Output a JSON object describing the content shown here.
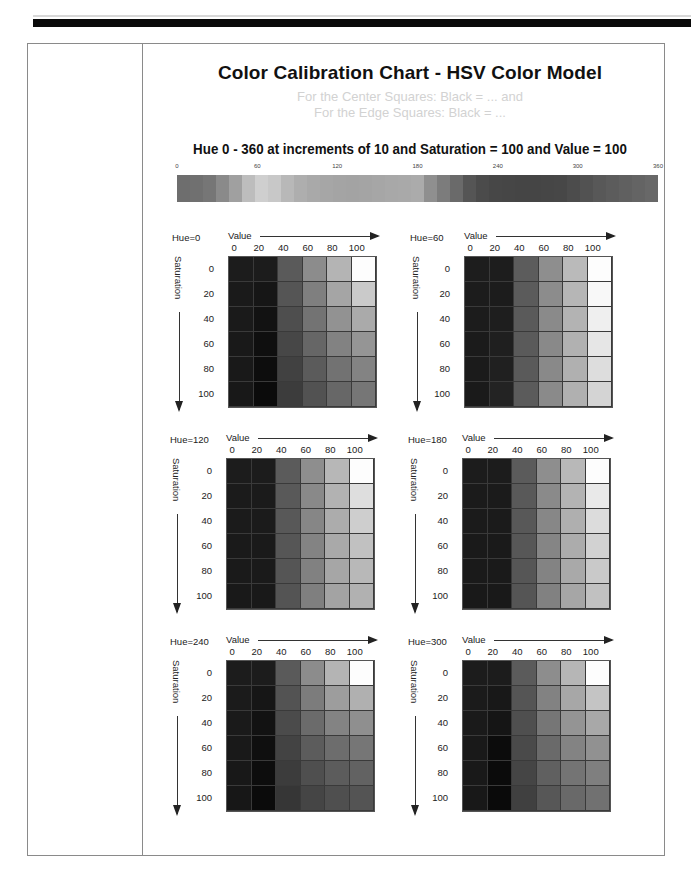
{
  "title": "Color Calibration Chart - HSV Color Model",
  "ghost_text": [
    "For the Center Squares: Black = ... and",
    "For the Edge Squares: Black = ..."
  ],
  "subtitle": "Hue 0 - 360 at increments of 10 and Saturation = 100 and Value = 100",
  "chart_data": {
    "type": "heatmap",
    "title": "Color Calibration Chart - HSV Color Model",
    "hue_strip": {
      "title": "Hue 0 - 360 at increments of 10 and Saturation = 100 and Value = 100",
      "tick_labels": [
        "0",
        "60",
        "120",
        "180",
        "240",
        "300",
        "360"
      ],
      "tick_positions_pct": [
        0,
        16.7,
        33.3,
        50,
        66.7,
        83.3,
        100
      ],
      "hues": [
        0,
        10,
        20,
        30,
        40,
        50,
        60,
        70,
        80,
        90,
        100,
        110,
        120,
        130,
        140,
        150,
        160,
        170,
        180,
        190,
        200,
        210,
        220,
        230,
        240,
        250,
        260,
        270,
        280,
        290,
        300,
        310,
        320,
        330,
        340,
        350,
        360
      ],
      "gray_levels": [
        "#6e6e6e",
        "#707070",
        "#767676",
        "#8a8a8a",
        "#a0a0a0",
        "#bdbdbd",
        "#cfcfcf",
        "#c8c8c8",
        "#b8b8b8",
        "#aeaeae",
        "#a9a9a9",
        "#a6a6a6",
        "#a4a4a4",
        "#a3a3a3",
        "#a4a4a4",
        "#a6a6a6",
        "#a8a8a8",
        "#a9a9a9",
        "#ababab",
        "#8f8f8f",
        "#7c7c7c",
        "#6a6a6a",
        "#555555",
        "#4b4b4b",
        "#474747",
        "#464646",
        "#454545",
        "#454545",
        "#464646",
        "#474747",
        "#4c4c4c",
        "#525252",
        "#585858",
        "#5c5c5c",
        "#606060",
        "#646464",
        "#686868"
      ]
    },
    "grids": [
      {
        "hue_label": "Hue=0",
        "hue": 0
      },
      {
        "hue_label": "Hue=60",
        "hue": 60
      },
      {
        "hue_label": "Hue=120",
        "hue": 120
      },
      {
        "hue_label": "Hue=180",
        "hue": 180
      },
      {
        "hue_label": "Hue=240",
        "hue": 240
      },
      {
        "hue_label": "Hue=300",
        "hue": 300
      }
    ],
    "xlabel": "Value",
    "ylabel": "Saturation",
    "x_ticks": [
      "0",
      "20",
      "40",
      "60",
      "80",
      "100"
    ],
    "y_ticks": [
      "0",
      "20",
      "40",
      "60",
      "80",
      "100"
    ],
    "rendering": "grayscale scan"
  },
  "grids": [
    {
      "hue_label": "Hue=0",
      "value_label": "Value",
      "sat_label": "Saturation",
      "rows": [
        [
          "#1c1c1c",
          "#1c1c1c",
          "#5a5a5a",
          "#8c8c8c",
          "#b4b4b4",
          "#fdfdfd"
        ],
        [
          "#1a1a1a",
          "#161616",
          "#555555",
          "#7f7f7f",
          "#a5a5a5",
          "#cacaca"
        ],
        [
          "#1a1a1a",
          "#121212",
          "#4e4e4e",
          "#737373",
          "#929292",
          "#aaaaaa"
        ],
        [
          "#191919",
          "#0f0f0f",
          "#474747",
          "#666666",
          "#828282",
          "#959595"
        ],
        [
          "#191919",
          "#0d0d0d",
          "#414141",
          "#5b5b5b",
          "#727272",
          "#838383"
        ],
        [
          "#181818",
          "#0b0b0b",
          "#3c3c3c",
          "#525252",
          "#676767",
          "#767676"
        ]
      ]
    },
    {
      "hue_label": "Hue=60",
      "value_label": "Value",
      "sat_label": "Saturation",
      "rows": [
        [
          "#1d1d1d",
          "#1d1d1d",
          "#5c5c5c",
          "#8e8e8e",
          "#bababa",
          "#fdfdfd"
        ],
        [
          "#1c1c1c",
          "#1c1c1c",
          "#5b5b5b",
          "#8c8c8c",
          "#b6b6b6",
          "#f8f8f8"
        ],
        [
          "#1c1c1c",
          "#1e1e1e",
          "#5a5a5a",
          "#8a8a8a",
          "#b3b3b3",
          "#efefef"
        ],
        [
          "#1b1b1b",
          "#1f1f1f",
          "#5a5a5a",
          "#898989",
          "#b1b1b1",
          "#e6e6e6"
        ],
        [
          "#1b1b1b",
          "#202020",
          "#5a5a5a",
          "#898989",
          "#b0b0b0",
          "#dddddd"
        ],
        [
          "#1a1a1a",
          "#232323",
          "#5b5b5b",
          "#8a8a8a",
          "#b0b0b0",
          "#d4d4d4"
        ]
      ]
    },
    {
      "hue_label": "Hue=120",
      "value_label": "Value",
      "sat_label": "Saturation",
      "rows": [
        [
          "#1c1c1c",
          "#1c1c1c",
          "#5b5b5b",
          "#8e8e8e",
          "#b7b7b7",
          "#fdfdfd"
        ],
        [
          "#1b1b1b",
          "#1b1b1b",
          "#595959",
          "#898989",
          "#b2b2b2",
          "#dedede"
        ],
        [
          "#1b1b1b",
          "#1b1b1b",
          "#585858",
          "#868686",
          "#acacac",
          "#cecece"
        ],
        [
          "#1a1a1a",
          "#1a1a1a",
          "#565656",
          "#838383",
          "#a9a9a9",
          "#c1c1c1"
        ],
        [
          "#1a1a1a",
          "#1a1a1a",
          "#555555",
          "#818181",
          "#a6a6a6",
          "#b8b8b8"
        ],
        [
          "#191919",
          "#191919",
          "#545454",
          "#7f7f7f",
          "#a3a3a3",
          "#b1b1b1"
        ]
      ]
    },
    {
      "hue_label": "Hue=180",
      "value_label": "Value",
      "sat_label": "Saturation",
      "rows": [
        [
          "#1c1c1c",
          "#1c1c1c",
          "#5b5b5b",
          "#8e8e8e",
          "#b8b8b8",
          "#fdfdfd"
        ],
        [
          "#1b1b1b",
          "#1b1b1b",
          "#595959",
          "#8a8a8a",
          "#b3b3b3",
          "#e9e9e9"
        ],
        [
          "#1b1b1b",
          "#1b1b1b",
          "#585858",
          "#878787",
          "#afafaf",
          "#dcdcdc"
        ],
        [
          "#1a1a1a",
          "#1a1a1a",
          "#575757",
          "#858585",
          "#acacac",
          "#d2d2d2"
        ],
        [
          "#1a1a1a",
          "#1a1a1a",
          "#565656",
          "#838383",
          "#a9a9a9",
          "#c9c9c9"
        ],
        [
          "#191919",
          "#191919",
          "#555555",
          "#818181",
          "#a6a6a6",
          "#c1c1c1"
        ]
      ]
    },
    {
      "hue_label": "Hue=240",
      "value_label": "Value",
      "sat_label": "Saturation",
      "rows": [
        [
          "#1c1c1c",
          "#1c1c1c",
          "#5a5a5a",
          "#8c8c8c",
          "#b4b4b4",
          "#fdfdfd"
        ],
        [
          "#1b1b1b",
          "#161616",
          "#535353",
          "#7c7c7c",
          "#9d9d9d",
          "#b0b0b0"
        ],
        [
          "#1a1a1a",
          "#121212",
          "#4b4b4b",
          "#6b6b6b",
          "#838383",
          "#8f8f8f"
        ],
        [
          "#191919",
          "#0f0f0f",
          "#434343",
          "#5c5c5c",
          "#6d6d6d",
          "#767676"
        ],
        [
          "#181818",
          "#0d0d0d",
          "#3c3c3c",
          "#4f4f4f",
          "#5c5c5c",
          "#626262"
        ],
        [
          "#171717",
          "#0b0b0b",
          "#363636",
          "#454545",
          "#4f4f4f",
          "#545454"
        ]
      ]
    },
    {
      "hue_label": "Hue=300",
      "value_label": "Value",
      "sat_label": "Saturation",
      "rows": [
        [
          "#1c1c1c",
          "#1c1c1c",
          "#5b5b5b",
          "#8d8d8d",
          "#b6b6b6",
          "#fdfdfd"
        ],
        [
          "#1b1b1b",
          "#181818",
          "#555555",
          "#828282",
          "#a7a7a7",
          "#c4c4c4"
        ],
        [
          "#1a1a1a",
          "#151515",
          "#4f4f4f",
          "#767676",
          "#949494",
          "#a8a8a8"
        ],
        [
          "#191919",
          "#0c0c0c",
          "#4a4a4a",
          "#6a6a6a",
          "#838383",
          "#919191"
        ],
        [
          "#191919",
          "#0b0b0b",
          "#454545",
          "#606060",
          "#747474",
          "#7f7f7f"
        ],
        [
          "#181818",
          "#0a0a0a",
          "#404040",
          "#575757",
          "#696969",
          "#717171"
        ]
      ]
    }
  ]
}
